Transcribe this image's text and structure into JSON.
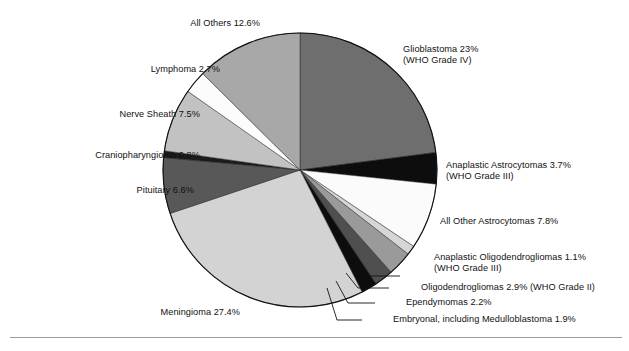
{
  "chart_data": {
    "type": "pie",
    "title": "",
    "subtitle": "",
    "xlabel": "",
    "ylabel": "",
    "legend_position": "none",
    "grid": false,
    "units": "percent",
    "start_angle_deg": 0,
    "direction": "clockwise",
    "center": {
      "x": 300,
      "y": 170
    },
    "radius": 137,
    "categories": [
      "Glioblastoma",
      "Anaplastic Astrocytomas",
      "All Other Astrocytomas",
      "Anaplastic Oligodendrogliomas",
      "Oligodendrogliomas",
      "Ependymomas",
      "Embryonal, including Medulloblastoma",
      "Meningioma",
      "Pituitary",
      "Craniopharyngioma",
      "Nerve Sheath",
      "Lymphoma",
      "All Others"
    ],
    "values": [
      23,
      3.7,
      7.8,
      1.1,
      2.9,
      2.2,
      1.9,
      27.4,
      6.6,
      0.8,
      7.5,
      2.7,
      12.6
    ],
    "colors": [
      "#6e6e6e",
      "#0d0d0d",
      "#fbfbfb",
      "#d6d6d6",
      "#9a9a9a",
      "#4f4f4f",
      "#0d0d0d",
      "#d3d3d3",
      "#585858",
      "#1c1c1c",
      "#c2c2c2",
      "#fcfcfc",
      "#a8a8a8"
    ],
    "slices": [
      {
        "name": "Glioblastoma",
        "value": 23,
        "label_line1": "Glioblastoma 23%",
        "label_line2": "(WHO Grade IV)",
        "color": "#6e6e6e"
      },
      {
        "name": "Anaplastic Astrocytomas",
        "value": 3.7,
        "label_line1": "Anaplastic Astrocytomas 3.7%",
        "label_line2": "(WHO Grade III)",
        "color": "#0d0d0d"
      },
      {
        "name": "All Other Astrocytomas",
        "value": 7.8,
        "label_line1": "All Other Astrocytomas 7.8%",
        "label_line2": "",
        "color": "#fbfbfb"
      },
      {
        "name": "Anaplastic Oligodendrogliomas",
        "value": 1.1,
        "label_line1": "Anaplastic Oligodendrogliomas 1.1%",
        "label_line2": "(WHO Grade III)",
        "color": "#d6d6d6"
      },
      {
        "name": "Oligodendrogliomas",
        "value": 2.9,
        "label_line1": "Oligodendrogliomas 2.9% (WHO Grade II)",
        "label_line2": "",
        "color": "#9a9a9a"
      },
      {
        "name": "Ependymomas",
        "value": 2.2,
        "label_line1": "Ependymomas 2.2%",
        "label_line2": "",
        "color": "#4f4f4f"
      },
      {
        "name": "Embryonal, including Medulloblastoma",
        "value": 1.9,
        "label_line1": "Embryonal, including Medulloblastoma 1.9%",
        "label_line2": "",
        "color": "#0d0d0d"
      },
      {
        "name": "Meningioma",
        "value": 27.4,
        "label_line1": "Meningioma 27.4%",
        "label_line2": "",
        "color": "#d3d3d3"
      },
      {
        "name": "Pituitary",
        "value": 6.6,
        "label_line1": "Pituitary 6.6%",
        "label_line2": "",
        "color": "#585858"
      },
      {
        "name": "Craniopharyngioma",
        "value": 0.8,
        "label_line1": "Craniopharyngioma 0.8%",
        "label_line2": "",
        "color": "#1c1c1c"
      },
      {
        "name": "Nerve Sheath",
        "value": 7.5,
        "label_line1": "Nerve Sheath 7.5%",
        "label_line2": "",
        "color": "#c2c2c2"
      },
      {
        "name": "Lymphoma",
        "value": 2.7,
        "label_line1": "Lymphoma 2.7%",
        "label_line2": "",
        "color": "#fcfcfc"
      },
      {
        "name": "All Others",
        "value": 12.6,
        "label_line1": "All Others 12.6%",
        "label_line2": "",
        "color": "#a8a8a8"
      }
    ]
  },
  "labels": {
    "glioblastoma_l1": "Glioblastoma 23%",
    "glioblastoma_l2": "(WHO Grade IV)",
    "anaplastic_astro_l1": "Anaplastic Astrocytomas 3.7%",
    "anaplastic_astro_l2": "(WHO Grade III)",
    "all_other_astro": "All Other Astrocytomas 7.8%",
    "anaplastic_oligo_l1": "Anaplastic Oligodendrogliomas 1.1%",
    "anaplastic_oligo_l2": "(WHO Grade III)",
    "oligodendrogliomas": "Oligodendrogliomas 2.9% (WHO Grade II)",
    "ependymomas": "Ependymomas 2.2%",
    "embryonal": "Embryonal, including Medulloblastoma 1.9%",
    "meningioma": "Meningioma 27.4%",
    "pituitary": "Pituitary 6.6%",
    "craniopharyngioma": "Craniopharyngioma 0.8%",
    "nerve_sheath": "Nerve Sheath 7.5%",
    "lymphoma": "Lymphoma 2.7%",
    "all_others": "All Others 12.6%"
  },
  "style": {
    "background": "#ffffff",
    "outline": "#111111",
    "rule": "#9a9a9a"
  }
}
